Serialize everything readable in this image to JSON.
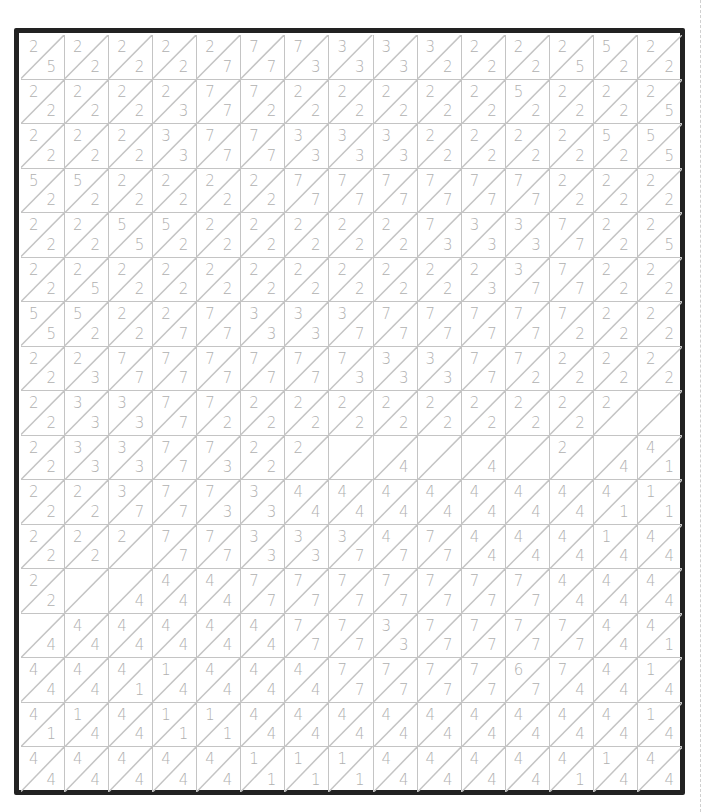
{
  "puzzle": {
    "columns": 15,
    "rows": 17,
    "colors": {
      "border": "#222222",
      "grid_line": "#c4c4c4",
      "digit": "#b0b0b0",
      "background": "#ffffff"
    },
    "cells": [
      [
        [
          "2",
          "5"
        ],
        [
          "2",
          "2"
        ],
        [
          "2",
          "2"
        ],
        [
          "2",
          "2"
        ],
        [
          "2",
          "7"
        ],
        [
          "7",
          "7"
        ],
        [
          "7",
          "3"
        ],
        [
          "3",
          "3"
        ],
        [
          "3",
          "3"
        ],
        [
          "3",
          "2"
        ],
        [
          "2",
          "2"
        ],
        [
          "2",
          "2"
        ],
        [
          "2",
          "5"
        ],
        [
          "5",
          "2"
        ],
        [
          "2",
          "2"
        ]
      ],
      [
        [
          "2",
          "2"
        ],
        [
          "2",
          "2"
        ],
        [
          "2",
          "2"
        ],
        [
          "2",
          "3"
        ],
        [
          "7",
          "7"
        ],
        [
          "7",
          "2"
        ],
        [
          "2",
          "2"
        ],
        [
          "2",
          "2"
        ],
        [
          "2",
          "2"
        ],
        [
          "2",
          "2"
        ],
        [
          "2",
          "2"
        ],
        [
          "5",
          "2"
        ],
        [
          "2",
          "2"
        ],
        [
          "2",
          "2"
        ],
        [
          "2",
          "5"
        ]
      ],
      [
        [
          "2",
          "2"
        ],
        [
          "2",
          "2"
        ],
        [
          "2",
          "2"
        ],
        [
          "3",
          "3"
        ],
        [
          "7",
          "7"
        ],
        [
          "7",
          "7"
        ],
        [
          "3",
          "3"
        ],
        [
          "3",
          "3"
        ],
        [
          "3",
          "3"
        ],
        [
          "2",
          "2"
        ],
        [
          "2",
          "2"
        ],
        [
          "2",
          "2"
        ],
        [
          "2",
          "2"
        ],
        [
          "5",
          "2"
        ],
        [
          "5",
          "5"
        ]
      ],
      [
        [
          "5",
          "2"
        ],
        [
          "5",
          "2"
        ],
        [
          "2",
          "2"
        ],
        [
          "2",
          "2"
        ],
        [
          "2",
          "2"
        ],
        [
          "2",
          "2"
        ],
        [
          "7",
          "7"
        ],
        [
          "7",
          "7"
        ],
        [
          "7",
          "7"
        ],
        [
          "7",
          "7"
        ],
        [
          "7",
          "7"
        ],
        [
          "7",
          "7"
        ],
        [
          "2",
          "2"
        ],
        [
          "2",
          "2"
        ],
        [
          "2",
          "2"
        ]
      ],
      [
        [
          "2",
          "2"
        ],
        [
          "2",
          "2"
        ],
        [
          "5",
          "5"
        ],
        [
          "5",
          "2"
        ],
        [
          "2",
          "2"
        ],
        [
          "2",
          "2"
        ],
        [
          "2",
          "2"
        ],
        [
          "2",
          "2"
        ],
        [
          "2",
          "2"
        ],
        [
          "7",
          "3"
        ],
        [
          "3",
          "3"
        ],
        [
          "3",
          "3"
        ],
        [
          "7",
          "7"
        ],
        [
          "2",
          "2"
        ],
        [
          "2",
          "5"
        ]
      ],
      [
        [
          "2",
          "2"
        ],
        [
          "2",
          "5"
        ],
        [
          "2",
          "2"
        ],
        [
          "2",
          "2"
        ],
        [
          "2",
          "2"
        ],
        [
          "2",
          "2"
        ],
        [
          "2",
          "2"
        ],
        [
          "2",
          "2"
        ],
        [
          "2",
          "2"
        ],
        [
          "2",
          "2"
        ],
        [
          "2",
          "3"
        ],
        [
          "3",
          "7"
        ],
        [
          "7",
          "7"
        ],
        [
          "2",
          "2"
        ],
        [
          "2",
          "2"
        ]
      ],
      [
        [
          "5",
          "5"
        ],
        [
          "5",
          "2"
        ],
        [
          "2",
          "2"
        ],
        [
          "2",
          "7"
        ],
        [
          "7",
          "7"
        ],
        [
          "3",
          "3"
        ],
        [
          "3",
          "3"
        ],
        [
          "3",
          "7"
        ],
        [
          "7",
          "7"
        ],
        [
          "7",
          "7"
        ],
        [
          "7",
          "7"
        ],
        [
          "7",
          "7"
        ],
        [
          "7",
          "2"
        ],
        [
          "2",
          "2"
        ],
        [
          "2",
          "2"
        ]
      ],
      [
        [
          "2",
          "2"
        ],
        [
          "2",
          "3"
        ],
        [
          "7",
          "7"
        ],
        [
          "7",
          "7"
        ],
        [
          "7",
          "7"
        ],
        [
          "7",
          "7"
        ],
        [
          "7",
          "7"
        ],
        [
          "7",
          "3"
        ],
        [
          "3",
          "3"
        ],
        [
          "3",
          "3"
        ],
        [
          "7",
          "7"
        ],
        [
          "7",
          "2"
        ],
        [
          "2",
          "2"
        ],
        [
          "2",
          "2"
        ],
        [
          "2",
          "2"
        ]
      ],
      [
        [
          "2",
          "2"
        ],
        [
          "3",
          "3"
        ],
        [
          "3",
          "3"
        ],
        [
          "7",
          "7"
        ],
        [
          "7",
          "2"
        ],
        [
          "2",
          "2"
        ],
        [
          "2",
          "2"
        ],
        [
          "2",
          "2"
        ],
        [
          "2",
          "2"
        ],
        [
          "2",
          "2"
        ],
        [
          "2",
          "2"
        ],
        [
          "2",
          "2"
        ],
        [
          "2",
          "2"
        ],
        [
          "2",
          ""
        ],
        [
          "",
          ""
        ]
      ],
      [
        [
          "2",
          "2"
        ],
        [
          "3",
          "3"
        ],
        [
          "3",
          "3"
        ],
        [
          "7",
          "7"
        ],
        [
          "7",
          "3"
        ],
        [
          "2",
          "2"
        ],
        [
          "2",
          ""
        ],
        [
          "",
          ""
        ],
        [
          "",
          "4"
        ],
        [
          "",
          ""
        ],
        [
          "",
          "4"
        ],
        [
          "",
          ""
        ],
        [
          "2",
          ""
        ],
        [
          "",
          "4"
        ],
        [
          "4",
          "1"
        ]
      ],
      [
        [
          "2",
          "2"
        ],
        [
          "2",
          "2"
        ],
        [
          "3",
          "7"
        ],
        [
          "7",
          "7"
        ],
        [
          "7",
          "3"
        ],
        [
          "3",
          "3"
        ],
        [
          "4",
          "4"
        ],
        [
          "4",
          "4"
        ],
        [
          "4",
          "4"
        ],
        [
          "4",
          "4"
        ],
        [
          "4",
          "4"
        ],
        [
          "4",
          "4"
        ],
        [
          "4",
          "4"
        ],
        [
          "4",
          "1"
        ],
        [
          "1",
          "1"
        ]
      ],
      [
        [
          "2",
          "2"
        ],
        [
          "2",
          "2"
        ],
        [
          "2",
          ""
        ],
        [
          "7",
          "7"
        ],
        [
          "7",
          "7"
        ],
        [
          "3",
          "3"
        ],
        [
          "3",
          "3"
        ],
        [
          "3",
          "7"
        ],
        [
          "4",
          "7"
        ],
        [
          "7",
          "7"
        ],
        [
          "4",
          "4"
        ],
        [
          "4",
          "4"
        ],
        [
          "4",
          "4"
        ],
        [
          "1",
          "4"
        ],
        [
          "4",
          "4"
        ]
      ],
      [
        [
          "2",
          "2"
        ],
        [
          "",
          ""
        ],
        [
          "",
          "4"
        ],
        [
          "4",
          "4"
        ],
        [
          "4",
          "4"
        ],
        [
          "7",
          "7"
        ],
        [
          "7",
          "7"
        ],
        [
          "7",
          "7"
        ],
        [
          "7",
          "7"
        ],
        [
          "7",
          "7"
        ],
        [
          "7",
          "7"
        ],
        [
          "7",
          "7"
        ],
        [
          "4",
          "4"
        ],
        [
          "4",
          "4"
        ],
        [
          "4",
          "4"
        ]
      ],
      [
        [
          "",
          "4"
        ],
        [
          "4",
          "4"
        ],
        [
          "4",
          "4"
        ],
        [
          "4",
          "4"
        ],
        [
          "4",
          "4"
        ],
        [
          "4",
          "4"
        ],
        [
          "7",
          "7"
        ],
        [
          "7",
          "7"
        ],
        [
          "3",
          "3"
        ],
        [
          "7",
          "7"
        ],
        [
          "7",
          "7"
        ],
        [
          "7",
          "7"
        ],
        [
          "7",
          "7"
        ],
        [
          "4",
          "4"
        ],
        [
          "4",
          "1"
        ]
      ],
      [
        [
          "4",
          "4"
        ],
        [
          "4",
          "4"
        ],
        [
          "4",
          "1"
        ],
        [
          "1",
          "4"
        ],
        [
          "4",
          "4"
        ],
        [
          "4",
          "4"
        ],
        [
          "4",
          "4"
        ],
        [
          "7",
          "7"
        ],
        [
          "7",
          "7"
        ],
        [
          "7",
          "7"
        ],
        [
          "7",
          "7"
        ],
        [
          "6",
          "7"
        ],
        [
          "7",
          "4"
        ],
        [
          "4",
          "4"
        ],
        [
          "1",
          "4"
        ]
      ],
      [
        [
          "4",
          "1"
        ],
        [
          "1",
          "4"
        ],
        [
          "4",
          "4"
        ],
        [
          "1",
          "1"
        ],
        [
          "1",
          "1"
        ],
        [
          "4",
          "4"
        ],
        [
          "4",
          "4"
        ],
        [
          "4",
          "4"
        ],
        [
          "4",
          "4"
        ],
        [
          "4",
          "4"
        ],
        [
          "4",
          "4"
        ],
        [
          "4",
          "4"
        ],
        [
          "4",
          "4"
        ],
        [
          "4",
          "4"
        ],
        [
          "1",
          "4"
        ]
      ],
      [
        [
          "4",
          "4"
        ],
        [
          "4",
          "4"
        ],
        [
          "4",
          "4"
        ],
        [
          "4",
          "4"
        ],
        [
          "4",
          "4"
        ],
        [
          "1",
          "1"
        ],
        [
          "1",
          "1"
        ],
        [
          "1",
          "1"
        ],
        [
          "4",
          "4"
        ],
        [
          "4",
          "4"
        ],
        [
          "4",
          "4"
        ],
        [
          "4",
          "4"
        ],
        [
          "4",
          "1"
        ],
        [
          "1",
          "4"
        ],
        [
          "4",
          "4"
        ]
      ]
    ]
  }
}
